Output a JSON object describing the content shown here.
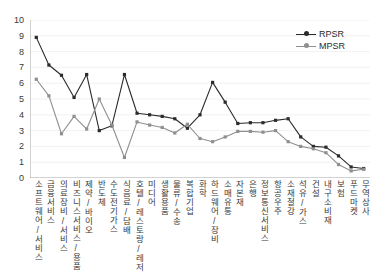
{
  "chart_data": {
    "type": "line",
    "title": "",
    "subtitle": "",
    "xlabel": "",
    "ylabel": "",
    "ylim": [
      0,
      10
    ],
    "yticks": [
      0,
      1,
      2,
      3,
      4,
      5,
      6,
      7,
      8,
      9,
      10
    ],
    "grid": true,
    "legend_position": "top-right",
    "categories": [
      "소프트웨어/서비스",
      "금융서비스",
      "의료장비/서비스",
      "비즈니스서비스/용품",
      "제약/바이오",
      "반도체",
      "수도전기가스",
      "식음료/담배",
      "호텔/레스토랑/레저",
      "미디어",
      "생활용품",
      "물류/수송",
      "복합기업",
      "화학",
      "하드웨어/장비",
      "소매유통",
      "자본재",
      "은행",
      "정보통신서비스",
      "항공우주",
      "소재철강",
      "석유/가스",
      "건설",
      "내구소비재",
      "보험",
      "푸드마켓",
      "무역상사"
    ],
    "series": [
      {
        "name": "RPSR",
        "color": "#2b2b2b",
        "values": [
          8.9,
          7.15,
          6.5,
          5.1,
          6.55,
          3.0,
          3.3,
          6.55,
          4.1,
          4.0,
          3.9,
          3.75,
          3.15,
          4.0,
          6.05,
          4.8,
          3.45,
          3.5,
          3.5,
          3.65,
          3.75,
          2.6,
          2.0,
          1.95,
          1.4,
          0.7,
          0.6
        ]
      },
      {
        "name": "MPSR",
        "color": "#8f8f8f",
        "values": [
          6.25,
          5.2,
          2.8,
          3.9,
          3.1,
          5.0,
          3.35,
          1.3,
          3.55,
          3.35,
          3.2,
          2.85,
          3.4,
          2.5,
          2.3,
          2.6,
          2.95,
          2.95,
          2.9,
          3.0,
          2.3,
          2.0,
          1.85,
          1.6,
          0.85,
          0.45,
          0.55
        ]
      }
    ]
  },
  "legend": {
    "items": [
      {
        "label": "RPSR"
      },
      {
        "label": "MPSR"
      }
    ]
  }
}
